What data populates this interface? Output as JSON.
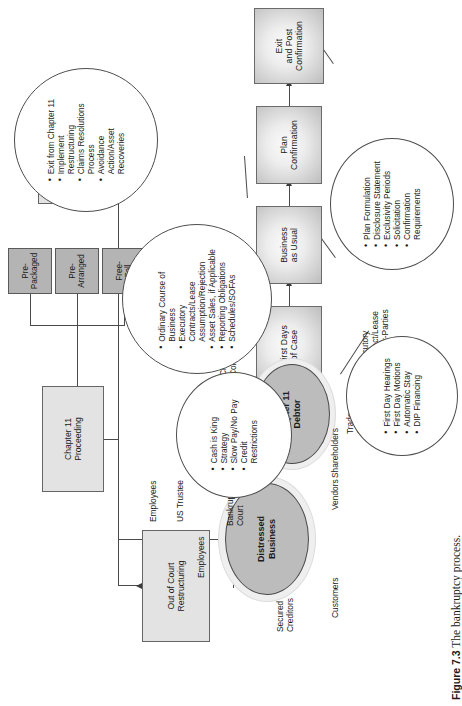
{
  "figure": {
    "number_label": "Figure 7.3",
    "caption_text": "The bankruptcy process."
  },
  "entities": {
    "distressed_business": "Distressed\nBusiness",
    "chapter11_debtor": "Chapter 11\nDebtor"
  },
  "boxes": {
    "out_of_court": "Out of Court\nRestructuring",
    "chapter11_proceeding": "Chapter 11\nProceeding",
    "chapter7_liquidation": "Chapter 7\nLiquidation",
    "free_fall": "Free-\nFall",
    "pre_arranged": "Pre-\nArranged",
    "pre_packaged": "Pre-\nPackaged",
    "first_days": "First Days\nof Case",
    "business_as_usual": "Business\nas Usual",
    "plan_confirmation": "Plan\nConfirmation",
    "exit_post_confirmation": "Exit\nand Post\nConfirmation"
  },
  "stakeholders": {
    "distressed": [
      "Customers",
      "Secured\nCreditors",
      "Employees",
      "Unsecured\nCreditors",
      "Vendors",
      "Shareholders"
    ],
    "debtor": [
      "Bankruptcy\nCourt",
      "US Trustee",
      "Employees",
      "Secured\nCreditors",
      "Creditors'\nCommittees",
      "Trade\nCreditors",
      "Customers",
      "Executory\nContract/Lease\nCounter-Parties"
    ]
  },
  "callouts": {
    "distressed_business": {
      "name": "distressed-business-callout",
      "items": [
        "Cash is King",
        "Strategy",
        "Slow Pay/No Pay",
        "Credit\nRestrictions"
      ]
    },
    "first_days": {
      "name": "first-days-callout",
      "items": [
        "First Day Hearings",
        "First Day Motions",
        "Automatic Stay",
        "DIP Financing"
      ]
    },
    "business_as_usual": {
      "name": "business-as-usual-callout",
      "items": [
        "Ordinary Course of\nBusiness",
        "Executory\nContracts/Lease\nAssumption/Rejection",
        "Asset Sales, if Applicable",
        "Reporting Obligations",
        "Schedules/SOFAs"
      ]
    },
    "plan_confirmation": {
      "name": "plan-confirmation-callout",
      "items": [
        "Plan Formulation",
        "Disclosure Statement",
        "Exclusivity Periods",
        "Solicitation",
        "Confirmation\nRequirements"
      ]
    },
    "exit_post_confirmation": {
      "name": "exit-post-confirmation-callout",
      "items": [
        "Exit from Chapter 11",
        "Implement\nRestructuring",
        "Claims Resolutions\nProcess",
        "Avoidance\nAction/Asset\nRecoveries"
      ]
    }
  },
  "colors": {
    "box_fill": "#e3e3e3",
    "dark_box_fill": "#b4b4b4",
    "entity_fill": "#bcbcbc",
    "entity_halo": "#efefef",
    "stroke": "#4a4a4a",
    "page_bg": "#ffffff"
  }
}
